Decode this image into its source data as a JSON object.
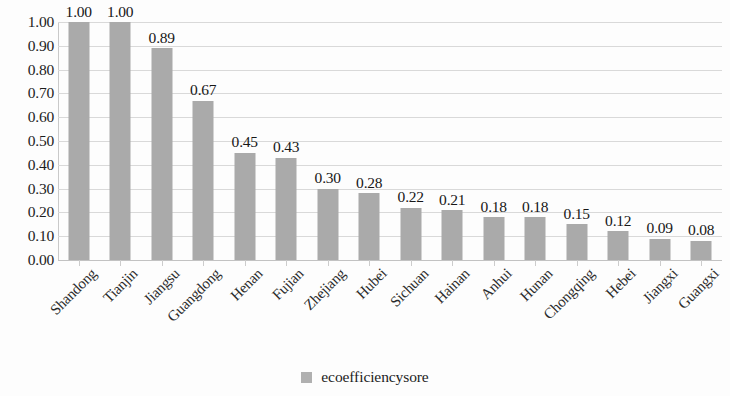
{
  "chart_data": {
    "type": "bar",
    "title": "",
    "subtitle": "",
    "xlabel": "",
    "ylabel": "",
    "categories": [
      "Shandong",
      "Tianjin",
      "Jiangsu",
      "Guangdong",
      "Henan",
      "Fujian",
      "Zhejiang",
      "Hubei",
      "Sichuan",
      "Hainan",
      "Anhui",
      "Hunan",
      "Chongqing",
      "Hebei",
      "Jiangxi",
      "Guangxi"
    ],
    "values": [
      1.0,
      1.0,
      0.89,
      0.67,
      0.45,
      0.43,
      0.3,
      0.28,
      0.22,
      0.21,
      0.18,
      0.18,
      0.15,
      0.12,
      0.09,
      0.08
    ],
    "value_labels": [
      "1.00",
      "1.00",
      "0.89",
      "0.67",
      "0.45",
      "0.43",
      "0.30",
      "0.28",
      "0.22",
      "0.21",
      "0.18",
      "0.18",
      "0.15",
      "0.12",
      "0.09",
      "0.08"
    ],
    "series": [
      {
        "name": "ecoefficiencysore",
        "values": [
          1.0,
          1.0,
          0.89,
          0.67,
          0.45,
          0.43,
          0.3,
          0.28,
          0.22,
          0.21,
          0.18,
          0.18,
          0.15,
          0.12,
          0.09,
          0.08
        ],
        "color": "#aaaaaa"
      }
    ],
    "ylim": [
      0.0,
      1.0
    ],
    "ytick_labels": [
      "1.00",
      "0.90",
      "0.80",
      "0.70",
      "0.60",
      "0.50",
      "0.40",
      "0.30",
      "0.20",
      "0.10",
      "0.00"
    ],
    "ytick_values": [
      1.0,
      0.9,
      0.8,
      0.7,
      0.6,
      0.5,
      0.4,
      0.3,
      0.2,
      0.1,
      0.0
    ],
    "grid": true,
    "grid_axis": "y",
    "legend_position": "bottom",
    "data_labels_shown": true,
    "x_label_rotation": -45
  },
  "legend": {
    "entries": [
      {
        "label": "ecoefficiencysore",
        "color": "#aaaaaa"
      }
    ]
  },
  "colors": {
    "bar": "#aaaaaa",
    "gridline": "#d9d9d9",
    "axis": "#c2c2c2",
    "text": "#1c1c1c",
    "background": "#fdfdfd"
  }
}
